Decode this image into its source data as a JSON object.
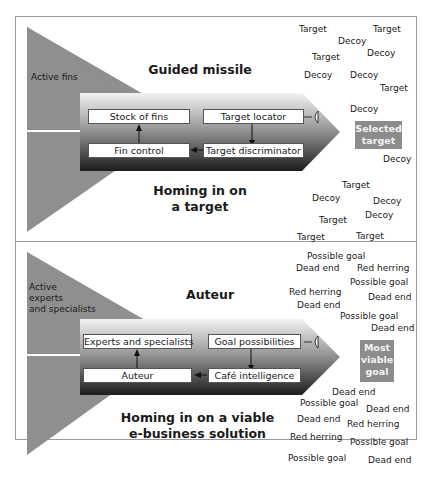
{
  "top_panel": {
    "fin_label": "Active fins",
    "title": "Guided missile",
    "subtitle_line1": "Homing in on",
    "subtitle_line2": "a target",
    "boxes": {
      "top_left": "Stock of fins",
      "top_right": "Target locator",
      "bottom_left": "Fin control",
      "bottom_right": "Target discriminator"
    },
    "selected": {
      "line1": "Selected",
      "line2": "target"
    },
    "scatter": [
      {
        "text": "Target",
        "x": 299,
        "y": 24
      },
      {
        "text": "Target",
        "x": 373,
        "y": 24
      },
      {
        "text": "Decoy",
        "x": 338,
        "y": 36
      },
      {
        "text": "Target",
        "x": 312,
        "y": 52
      },
      {
        "text": "Decoy",
        "x": 367,
        "y": 48
      },
      {
        "text": "Decoy",
        "x": 304,
        "y": 70
      },
      {
        "text": "Decoy",
        "x": 350,
        "y": 70
      },
      {
        "text": "Target",
        "x": 380,
        "y": 83
      },
      {
        "text": "Decoy",
        "x": 350,
        "y": 104
      },
      {
        "text": "Decoy",
        "x": 383,
        "y": 154
      },
      {
        "text": "Target",
        "x": 342,
        "y": 180
      },
      {
        "text": "Decoy",
        "x": 312,
        "y": 193
      },
      {
        "text": "Decoy",
        "x": 373,
        "y": 196
      },
      {
        "text": "Target",
        "x": 319,
        "y": 215
      },
      {
        "text": "Decoy",
        "x": 365,
        "y": 210
      },
      {
        "text": "Target",
        "x": 297,
        "y": 232
      },
      {
        "text": "Target",
        "x": 356,
        "y": 231
      }
    ]
  },
  "bottom_panel": {
    "fin_label_line1": "Active",
    "fin_label_line2": "experts",
    "fin_label_line3": "and specialists",
    "title": "Auteur",
    "subtitle_line1": "Homing in on a viable",
    "subtitle_line2": "e-business solution",
    "boxes": {
      "top_left": "Experts and specialists",
      "top_right": "Goal possibilities",
      "bottom_left": "Auteur",
      "bottom_right": "Café intelligence"
    },
    "selected": {
      "line1": "Most",
      "line2": "viable",
      "line3": "goal"
    },
    "scatter": [
      {
        "text": "Possible goal",
        "x": 307,
        "y": 251
      },
      {
        "text": "Dead end",
        "x": 296,
        "y": 263
      },
      {
        "text": "Red herring",
        "x": 357,
        "y": 263
      },
      {
        "text": "Possible goal",
        "x": 350,
        "y": 277
      },
      {
        "text": "Red herring",
        "x": 289,
        "y": 287
      },
      {
        "text": "Dead end",
        "x": 368,
        "y": 292
      },
      {
        "text": "Dead end",
        "x": 297,
        "y": 300
      },
      {
        "text": "Possible goal",
        "x": 340,
        "y": 311
      },
      {
        "text": "Dead end",
        "x": 371,
        "y": 323
      },
      {
        "text": "Dead end",
        "x": 332,
        "y": 387
      },
      {
        "text": "Possible goal",
        "x": 300,
        "y": 398
      },
      {
        "text": "Dead end",
        "x": 366,
        "y": 404
      },
      {
        "text": "Dead end",
        "x": 297,
        "y": 414
      },
      {
        "text": "Red herring",
        "x": 347,
        "y": 419
      },
      {
        "text": "Red herring",
        "x": 290,
        "y": 432
      },
      {
        "text": "Possible goal",
        "x": 350,
        "y": 437
      },
      {
        "text": "Possible goal",
        "x": 288,
        "y": 453
      },
      {
        "text": "Dead end",
        "x": 368,
        "y": 455
      }
    ]
  }
}
